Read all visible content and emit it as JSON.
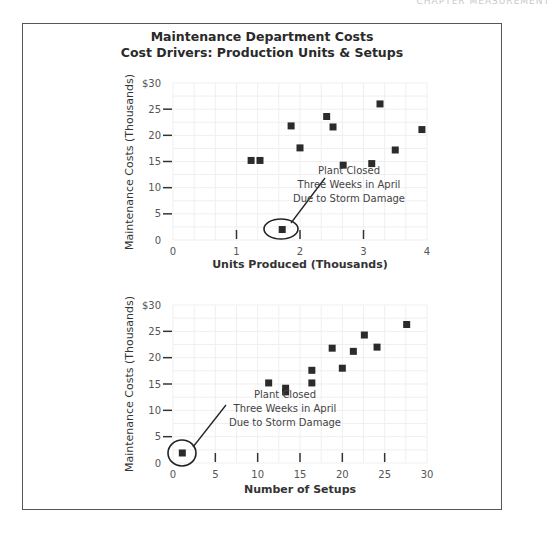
{
  "running_header": "CHAPTER   MEASUREMENT",
  "figure": {
    "title_line1": "Maintenance Department Costs",
    "title_line2": "Cost Drivers: Production Units & Setups"
  },
  "chart_data": [
    {
      "type": "scatter",
      "title": "Maintenance Costs vs Units Produced",
      "xlabel": "Units Produced (Thousands)",
      "ylabel": "Maintenance Costs (Thousands)",
      "xlim": [
        0,
        4
      ],
      "ylim": [
        0,
        30
      ],
      "x_ticks": [
        "0",
        "1",
        "2",
        "3",
        "4"
      ],
      "y_ticks": [
        "0",
        "5",
        "10",
        "15",
        "20",
        "25",
        "$30"
      ],
      "grid": true,
      "points": [
        {
          "x": 1.23,
          "y": 15.2
        },
        {
          "x": 1.37,
          "y": 15.2
        },
        {
          "x": 1.86,
          "y": 21.8
        },
        {
          "x": 2.0,
          "y": 17.6
        },
        {
          "x": 2.42,
          "y": 23.6
        },
        {
          "x": 2.52,
          "y": 21.6
        },
        {
          "x": 2.68,
          "y": 14.3
        },
        {
          "x": 3.13,
          "y": 14.6
        },
        {
          "x": 3.26,
          "y": 26.0
        },
        {
          "x": 3.5,
          "y": 17.2
        },
        {
          "x": 3.92,
          "y": 21.1
        },
        {
          "x": 1.72,
          "y": 2.0,
          "outlier": true
        }
      ],
      "annotation": {
        "lines": [
          "Plant Closed",
          "Three Weeks in April",
          "Due to Storm Damage"
        ],
        "target_index": 11
      }
    },
    {
      "type": "scatter",
      "title": "Maintenance Costs vs Number of Setups",
      "xlabel": "Number of Setups",
      "ylabel": "Maintenance Costs (Thousands)",
      "xlim": [
        0,
        30
      ],
      "ylim": [
        0,
        30
      ],
      "x_ticks": [
        "0",
        "5",
        "10",
        "15",
        "20",
        "25",
        "30"
      ],
      "y_ticks": [
        "0",
        "5",
        "10",
        "15",
        "20",
        "25",
        "$30"
      ],
      "grid": true,
      "points": [
        {
          "x": 11.3,
          "y": 15.2
        },
        {
          "x": 13.3,
          "y": 14.2
        },
        {
          "x": 13.3,
          "y": 13.5
        },
        {
          "x": 16.4,
          "y": 17.6
        },
        {
          "x": 16.4,
          "y": 15.2
        },
        {
          "x": 18.8,
          "y": 21.8
        },
        {
          "x": 20.0,
          "y": 18.0
        },
        {
          "x": 21.3,
          "y": 21.2
        },
        {
          "x": 22.6,
          "y": 24.3
        },
        {
          "x": 24.1,
          "y": 22.0
        },
        {
          "x": 27.6,
          "y": 26.3
        },
        {
          "x": 1.1,
          "y": 1.9,
          "outlier": true
        }
      ],
      "annotation": {
        "lines": [
          "Plant Closed",
          "Three Weeks in April",
          "Due to Storm Damage"
        ],
        "target_index": 11
      }
    }
  ],
  "colors": {
    "marker": "#2b2b2b",
    "grid": "#efefef",
    "frame": "#555555"
  }
}
